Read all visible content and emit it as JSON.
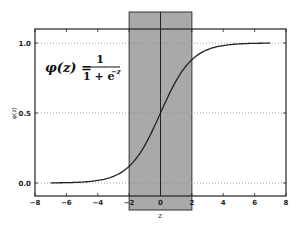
{
  "chart_data": {
    "type": "line",
    "title": "",
    "xlabel": "z",
    "ylabel": "φ(z)",
    "xlim": [
      -8,
      8
    ],
    "ylim": [
      -0.1,
      1.1
    ],
    "x_ticks": [
      -8,
      -6,
      -4,
      -2,
      0,
      2,
      4,
      6,
      8
    ],
    "x_tick_labels": [
      "−8",
      "−6",
      "−4",
      "−2",
      "0",
      "2",
      "4",
      "6",
      "8"
    ],
    "y_ticks": [
      0.0,
      0.5,
      1.0
    ],
    "y_tick_labels": [
      "0.0",
      "0.5",
      "1.0"
    ],
    "grid": {
      "horizontal_dotted_at": [
        0.0,
        0.5,
        1.0
      ]
    },
    "legend": null,
    "series": [
      {
        "name": "sigmoid",
        "function": "1/(1+exp(-z))",
        "x": [
          -7,
          -6,
          -5,
          -4,
          -3,
          -2,
          -1,
          0,
          1,
          2,
          3,
          4,
          5,
          6,
          7
        ],
        "values": [
          0.001,
          0.002,
          0.007,
          0.018,
          0.047,
          0.119,
          0.269,
          0.5,
          0.731,
          0.881,
          0.953,
          0.982,
          0.993,
          0.998,
          0.999
        ],
        "color": "#222222"
      }
    ],
    "annotations": [
      {
        "type": "text",
        "text": "φ(z) = 1 / (1 + e^(−z))",
        "position": "upper-left"
      },
      {
        "type": "shaded_region",
        "x_range": [
          -2,
          2
        ],
        "color": "#a9a9a9",
        "extends_beyond_axes": true
      },
      {
        "type": "vertical_line",
        "x": 0,
        "color": "#222222"
      }
    ]
  },
  "formula": {
    "lhs": "φ(z) =",
    "numerator": "1",
    "denominator": "1 + e",
    "exponent": "−z"
  },
  "axis": {
    "xlabel": "z",
    "ylabel": "φ(z)"
  }
}
